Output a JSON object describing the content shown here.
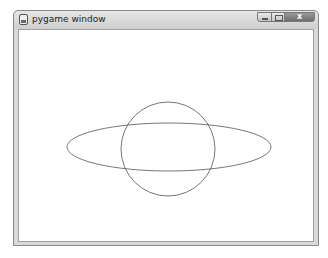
{
  "window": {
    "title": "pygame window",
    "icon": "pygame-icon",
    "buttons": {
      "minimize": "minimize-icon",
      "maximize": "maximize-icon",
      "close": "x"
    }
  },
  "canvas": {
    "background": "#ffffff",
    "stroke": "#555555",
    "shapes": [
      {
        "type": "ellipse",
        "cx": 150,
        "cy": 117,
        "rx": 102,
        "ry": 24
      },
      {
        "type": "circle",
        "cx": 149,
        "cy": 119,
        "r": 47
      }
    ]
  }
}
